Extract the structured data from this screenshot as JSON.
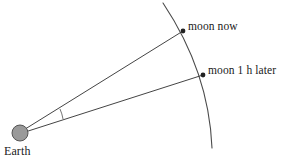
{
  "figure": {
    "background_color": "#ffffff",
    "width": 289,
    "height": 162
  },
  "labels": {
    "moon_now": "moon now",
    "moon_later": "moon 1 h later",
    "earth": "Earth"
  },
  "colors": {
    "line": "#3a3a3a",
    "arc": "#4a4a4a",
    "earth_fill": "#9a9a9a",
    "earth_stroke": "#555555",
    "marker": "#222222",
    "text": "#1a1a1a"
  },
  "geometry": {
    "earth_center": [
      20,
      133
    ],
    "earth_radius": 8,
    "moon_now_point": [
      183,
      31
    ],
    "moon_later_point": [
      203,
      75
    ],
    "arc_start": [
      163,
      3
    ],
    "arc_end": [
      212,
      148
    ],
    "marker_radius": 2.4,
    "angle_arc_radius": 28
  }
}
